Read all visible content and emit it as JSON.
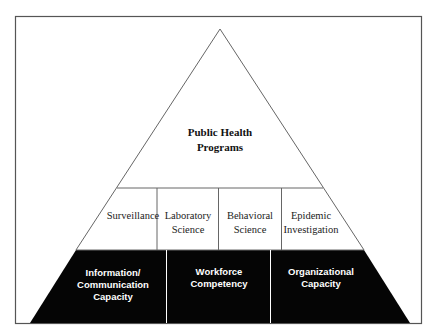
{
  "diagram": {
    "type": "pyramid",
    "frame": {
      "border_color": "#555555"
    },
    "top": {
      "lines": [
        "Public Health",
        "Programs"
      ]
    },
    "middle": [
      {
        "lines": [
          "Surveillance"
        ]
      },
      {
        "lines": [
          "Laboratory",
          "Science"
        ]
      },
      {
        "lines": [
          "Behavioral",
          "Science"
        ]
      },
      {
        "lines": [
          "Epidemic",
          "Investigation"
        ]
      }
    ],
    "base": [
      {
        "lines": [
          "Information/",
          "Communication",
          "Capacity"
        ]
      },
      {
        "lines": [
          "Workforce",
          "Competency"
        ]
      },
      {
        "lines": [
          "Organizational",
          "Capacity"
        ]
      }
    ],
    "colors": {
      "line": "#666666",
      "base_fill": "#050505",
      "base_text": "#ffffff",
      "text": "#111111"
    }
  }
}
